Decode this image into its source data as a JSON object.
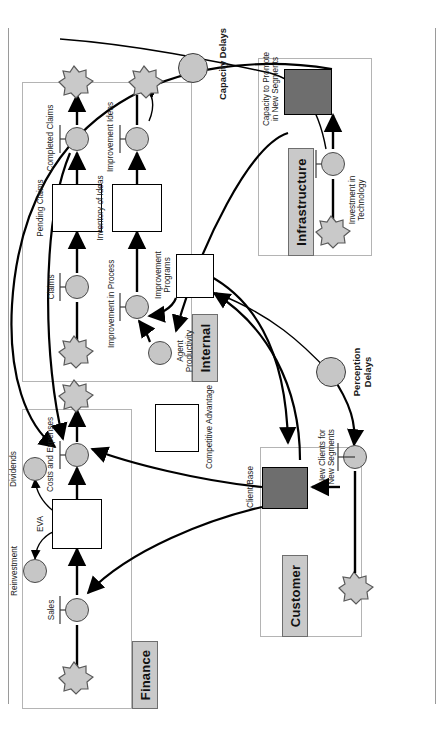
{
  "diagram": {
    "orientation": "rotated-90-ccw",
    "colors": {
      "panel_border": "#b4b4b4",
      "panel_title_fill": "#c9c9c9",
      "valve_fill": "#c6c6c6",
      "cloud_fill": "#c9c9c9",
      "stock_fill_highlight": "#6e6e6e",
      "stock_fill_plain": "#ffffff",
      "line": "#000000"
    },
    "panels": [
      {
        "id": "finance",
        "label": "Finance"
      },
      {
        "id": "internal",
        "label": "Internal"
      },
      {
        "id": "customer",
        "label": "Customer"
      },
      {
        "id": "infrastructure",
        "label": "Infrastructure"
      }
    ],
    "stocks": [
      {
        "id": "eva",
        "label": "EVA",
        "panel": "finance",
        "style": "plain"
      },
      {
        "id": "pending_claims",
        "label": "Pending Claims",
        "panel": "internal",
        "style": "plain"
      },
      {
        "id": "inventory_ideas",
        "label": "Inventory of Ideas",
        "panel": "internal",
        "style": "plain"
      },
      {
        "id": "improvement_programs",
        "label": "Improvement\nPrograms",
        "panel": "internal",
        "style": "plain"
      },
      {
        "id": "competitive_advantage",
        "label": "Competitive Advantage",
        "panel": "internal",
        "style": "plain"
      },
      {
        "id": "client_base",
        "label": "Client Base",
        "panel": "customer",
        "style": "filled"
      },
      {
        "id": "capacity_promote",
        "label": "Capacity to Promote\nin New Segments",
        "panel": "infrastructure",
        "style": "filled"
      }
    ],
    "flows": [
      {
        "id": "sales",
        "label": "Sales",
        "panel": "finance"
      },
      {
        "id": "costs_and_expenses",
        "label": "Costs and Expenses",
        "panel": "finance"
      },
      {
        "id": "dividends",
        "label": "Dividends",
        "panel": "finance"
      },
      {
        "id": "reinvestment",
        "label": "Reinvestment",
        "panel": "finance"
      },
      {
        "id": "claims",
        "label": "Claims",
        "panel": "internal"
      },
      {
        "id": "completed_claims",
        "label": "Completed Claims",
        "panel": "internal"
      },
      {
        "id": "improvement_in_process",
        "label": "Improvement in Process",
        "panel": "internal"
      },
      {
        "id": "improvement_ideas",
        "label": "Improvement Ideas",
        "panel": "internal"
      },
      {
        "id": "agent_productivity",
        "label": "Agent\nProductivity",
        "panel": "internal"
      },
      {
        "id": "new_clients",
        "label": "New Clients for\nNew Segments",
        "panel": "customer"
      },
      {
        "id": "investment_tech",
        "label": "Investment in\nTechnology",
        "panel": "infrastructure"
      }
    ],
    "delays": [
      {
        "id": "capacity_delays",
        "label": "Capacity Delays"
      },
      {
        "id": "perception_delays",
        "label": "Perception\nDelays"
      }
    ]
  }
}
